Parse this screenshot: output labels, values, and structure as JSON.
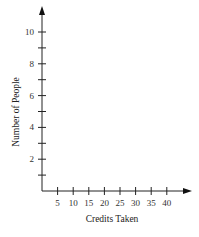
{
  "chart_data": {
    "type": "scatter",
    "title": "",
    "xlabel": "Credits Taken",
    "ylabel": "Number of People",
    "x_ticks": [
      5,
      10,
      15,
      20,
      25,
      30,
      35,
      40
    ],
    "x_tick_labels": [
      "5",
      "10",
      "15",
      "20",
      "25",
      "30",
      "35",
      "40"
    ],
    "y_ticks": [
      1,
      2,
      3,
      4,
      5,
      6,
      7,
      8,
      9,
      10
    ],
    "y_tick_labels": [
      "2",
      "4",
      "6",
      "8",
      "10"
    ],
    "xlim": [
      0,
      45
    ],
    "ylim": [
      0,
      11
    ],
    "grid": false,
    "legend": null,
    "series": [],
    "note": "Empty axes; no data plotted"
  },
  "axes": {
    "x_title": "Credits Taken",
    "y_title": "Number of People"
  }
}
